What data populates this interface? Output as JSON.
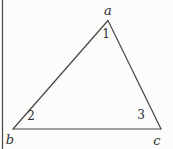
{
  "figure": {
    "type": "triangle-diagram",
    "vertices": [
      {
        "label": "a",
        "position": "top"
      },
      {
        "label": "b",
        "position": "bottom-left"
      },
      {
        "label": "c",
        "position": "bottom-right"
      }
    ],
    "angles": [
      {
        "label": "1",
        "at_vertex": "a"
      },
      {
        "label": "2",
        "at_vertex": "b"
      },
      {
        "label": "3",
        "at_vertex": "c"
      }
    ],
    "line_color": "#454545",
    "background_color": "#fcfcfb"
  }
}
